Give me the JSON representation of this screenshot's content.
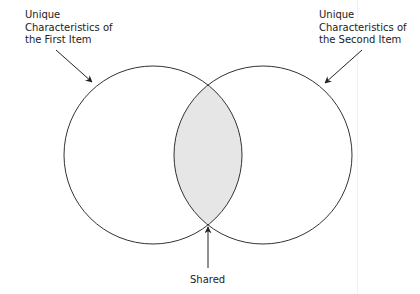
{
  "diagram": {
    "type": "venn",
    "sets": [
      {
        "id": "first",
        "label_lines": [
          "Unique",
          "Characteristics of",
          "the First Item"
        ]
      },
      {
        "id": "second",
        "label_lines": [
          "Unique",
          "Characteristics of",
          "the Second Item"
        ]
      }
    ],
    "intersection": {
      "label": "Shared",
      "fill": "#e6e6e6"
    },
    "colors": {
      "stroke": "#333333",
      "text": "#222222",
      "background": "#ffffff"
    }
  }
}
